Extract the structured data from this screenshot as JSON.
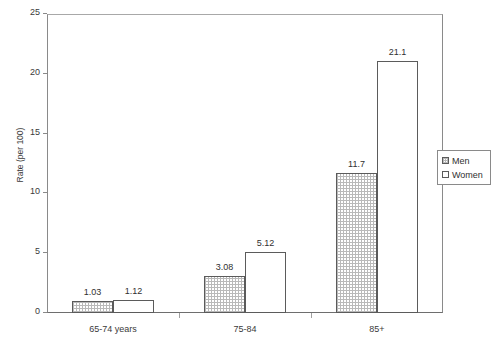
{
  "chart_data": {
    "type": "bar",
    "title": "",
    "subtitle": "",
    "xlabel": "",
    "ylabel": "Rate (per 100)",
    "categories": [
      "65-74 years",
      "75-84",
      "85+"
    ],
    "series": [
      {
        "name": "Men",
        "values": [
          1.03,
          3.08,
          11.7
        ],
        "fill": "dotted-hatch",
        "fill_color": "#ffffff",
        "hatch_color": "#b9b9b9"
      },
      {
        "name": "Women",
        "values": [
          1.12,
          5.12,
          21.1
        ],
        "fill": "solid",
        "fill_color": "#ffffff",
        "hatch_color": ""
      }
    ],
    "value_labels": {
      "Men": [
        "1.03",
        "3.08",
        "11.7"
      ],
      "Women": [
        "1.12",
        "5.12",
        "21.1"
      ]
    },
    "ylim": [
      0,
      25
    ],
    "ytick_values": [
      0,
      5,
      10,
      15,
      20,
      25
    ],
    "ytick_labels": [
      "0",
      "5",
      "10",
      "15",
      "20",
      "25"
    ],
    "grid": false,
    "legend_position": "right-outside",
    "legend_entries": [
      "Men",
      "Women"
    ],
    "bar_border_color": "#5b5b5b",
    "axis_color": "#8a8a8a",
    "text_color": "#303030"
  }
}
